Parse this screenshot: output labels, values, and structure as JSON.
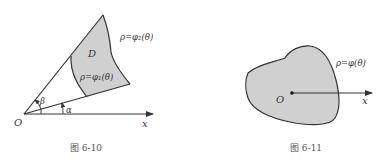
{
  "figures": [
    {
      "id": "fig-6-10",
      "caption": "图 6-10",
      "origin_label": "O",
      "axis_label": "x",
      "region_label": "D",
      "outer_curve_label": "ρ=φ₂(θ)",
      "inner_curve_label": "ρ=φ₁(θ)",
      "angle_labels": {
        "upper": "β",
        "lower": "α"
      }
    },
    {
      "id": "fig-6-11",
      "caption": "图 6-11",
      "origin_label": "O",
      "axis_label": "x",
      "curve_label": "ρ=φ(θ)"
    }
  ],
  "colors": {
    "fill": "#d0d0d0",
    "stroke": "#333333",
    "background": "#ffffff"
  }
}
